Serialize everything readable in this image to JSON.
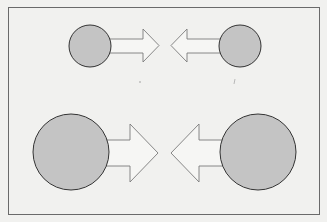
{
  "diagram": {
    "colors": {
      "background": "#f1f1ef",
      "frame_stroke": "#6a6a6a",
      "circle_fill": "#c4c4c4",
      "circle_stroke": "#333333",
      "arrow_fill": "#f6f6f4",
      "arrow_stroke": "#7a7a7a"
    },
    "rows": [
      {
        "name": "small-pair",
        "left": {
          "shape": "circle",
          "size": "small",
          "arrow_direction": "right"
        },
        "right": {
          "shape": "circle",
          "size": "small",
          "arrow_direction": "left"
        }
      },
      {
        "name": "large-pair",
        "left": {
          "shape": "circle",
          "size": "large",
          "arrow_direction": "right"
        },
        "right": {
          "shape": "circle",
          "size": "large",
          "arrow_direction": "left"
        }
      }
    ]
  }
}
